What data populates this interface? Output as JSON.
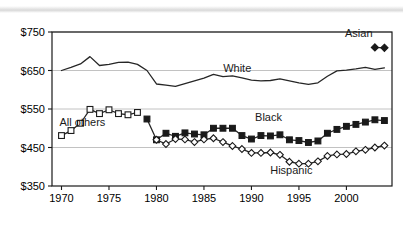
{
  "chart_data": {
    "type": "line",
    "title": "",
    "subtitle": "",
    "xlabel": "",
    "ylabel": "",
    "xlim": [
      1969,
      2004.8
    ],
    "ylim": [
      350,
      750
    ],
    "grid": true,
    "legend_position": "inline-annotations",
    "y_ticks": [
      "$350",
      "$450",
      "$550",
      "$650",
      "$750"
    ],
    "y_tick_values": [
      350,
      450,
      550,
      650,
      750
    ],
    "x_ticks": [
      "1970",
      "1975",
      "1980",
      "1985",
      "1990",
      "1995",
      "2000"
    ],
    "x_tick_values": [
      1970,
      1975,
      1980,
      1985,
      1990,
      1995,
      2000
    ],
    "series": [
      {
        "name": "White",
        "label": "White",
        "marker": "none",
        "label_x": 1988.5,
        "label_y": 645,
        "x": [
          1970,
          1971,
          1972,
          1973,
          1974,
          1975,
          1976,
          1977,
          1978,
          1979,
          1980,
          1981,
          1982,
          1983,
          1984,
          1985,
          1986,
          1987,
          1988,
          1989,
          1990,
          1991,
          1992,
          1993,
          1994,
          1995,
          1996,
          1997,
          1998,
          1999,
          2000,
          2001,
          2002,
          2003,
          2004
        ],
        "values": [
          650,
          658,
          667,
          686,
          663,
          666,
          671,
          672,
          666,
          650,
          615,
          612,
          609,
          616,
          623,
          630,
          640,
          634,
          636,
          631,
          625,
          623,
          624,
          628,
          623,
          618,
          614,
          618,
          635,
          649,
          651,
          654,
          658,
          653,
          657
        ]
      },
      {
        "name": "All others",
        "label": "All others",
        "marker": "open-square",
        "label_x": 1972.2,
        "label_y": 505,
        "x": [
          1970,
          1971,
          1972,
          1973,
          1974,
          1975,
          1976,
          1977,
          1978
        ],
        "values": [
          481,
          494,
          513,
          549,
          538,
          548,
          538,
          535,
          541
        ]
      },
      {
        "name": "Black",
        "label": "Black",
        "marker": "filled-square",
        "label_x": 1991.8,
        "label_y": 519,
        "x": [
          1979,
          1980,
          1981,
          1982,
          1983,
          1984,
          1985,
          1986,
          1987,
          1988,
          1989,
          1990,
          1991,
          1992,
          1993,
          1994,
          1995,
          1996,
          1997,
          1998,
          1999,
          2000,
          2001,
          2002,
          2003,
          2004
        ],
        "values": [
          524,
          470,
          487,
          479,
          488,
          485,
          483,
          500,
          500,
          500,
          481,
          472,
          481,
          480,
          483,
          470,
          468,
          463,
          467,
          487,
          497,
          505,
          510,
          516,
          522,
          520
        ]
      },
      {
        "name": "Hispanic",
        "label": "Hispanic",
        "marker": "open-diamond",
        "label_x": 1994.2,
        "label_y": 382,
        "x": [
          1980,
          1981,
          1982,
          1983,
          1984,
          1985,
          1986,
          1987,
          1988,
          1989,
          1990,
          1991,
          1992,
          1993,
          1994,
          1995,
          1996,
          1997,
          1998,
          1999,
          2000,
          2001,
          2002,
          2003,
          2004
        ],
        "values": [
          470,
          459,
          472,
          471,
          464,
          471,
          474,
          464,
          454,
          446,
          436,
          436,
          437,
          431,
          413,
          408,
          408,
          414,
          428,
          432,
          433,
          440,
          444,
          450,
          455
        ]
      },
      {
        "name": "Asian",
        "label": "Asian",
        "marker": "filled-diamond",
        "label_x": 2001.3,
        "label_y": 736,
        "x": [
          2003,
          2004
        ],
        "values": [
          710,
          709
        ]
      }
    ]
  }
}
